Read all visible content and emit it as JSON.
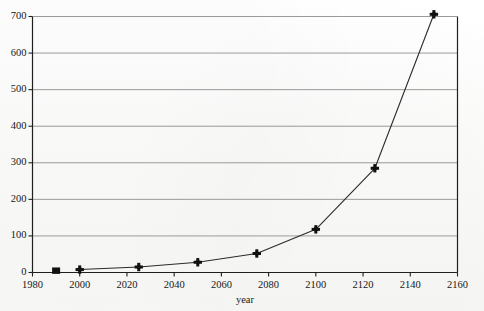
{
  "chart_data": {
    "type": "line",
    "title": "",
    "xlabel": "year",
    "ylabel": "",
    "xlim": [
      1980,
      2160
    ],
    "ylim": [
      0,
      700
    ],
    "xticks": [
      1980,
      2000,
      2020,
      2040,
      2060,
      2080,
      2100,
      2120,
      2140,
      2160
    ],
    "xtick_labels": [
      "1980",
      "2000",
      "2020",
      "2040",
      "2060",
      "2080",
      "2100",
      "2120",
      "2140",
      "2160"
    ],
    "yticks": [
      0,
      100,
      200,
      300,
      400,
      500,
      600,
      700
    ],
    "ytick_labels": [
      "0",
      "100",
      "200",
      "300",
      "400",
      "500",
      "600",
      "700"
    ],
    "grid": {
      "horizontal": true,
      "vertical": false
    },
    "legend": {
      "visible": false,
      "position": "none"
    },
    "series": [
      {
        "name": "projection",
        "marker": "plus",
        "line_color": "#2b2b2b",
        "marker_color": "#111111",
        "x": [
          2000,
          2025,
          2050,
          2075,
          2100,
          2125,
          2150
        ],
        "values": [
          8,
          15,
          28,
          52,
          118,
          285,
          706
        ]
      },
      {
        "name": "observed",
        "marker": "square",
        "line_color": "none",
        "marker_color": "#111111",
        "x": [
          1990
        ],
        "values": [
          5
        ]
      }
    ],
    "colors": {
      "background": "#fcfcfb",
      "axis": "#1f1f1f",
      "grid": "#9a9a9a",
      "text": "#171717",
      "data": "#111111"
    }
  }
}
